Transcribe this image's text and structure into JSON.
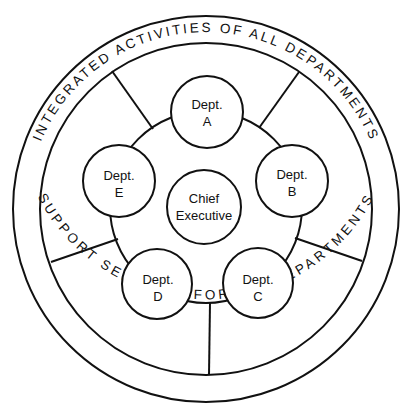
{
  "diagram": {
    "outer_ring": {
      "top_label": "INTEGRATED ACTIVITIES OF ALL DEPARTMENTS",
      "bottom_label": "SUPPORT SERVICES FOR ALL DEPARTMENTS"
    },
    "center": {
      "line1": "Chief",
      "line2": "Executive"
    },
    "departments": [
      {
        "id": "A",
        "line1": "Dept.",
        "line2": "A"
      },
      {
        "id": "B",
        "line1": "Dept.",
        "line2": "B"
      },
      {
        "id": "C",
        "line1": "Dept.",
        "line2": "C"
      },
      {
        "id": "D",
        "line1": "Dept.",
        "line2": "D"
      },
      {
        "id": "E",
        "line1": "Dept.",
        "line2": "E"
      }
    ],
    "colors": {
      "line": "#111111",
      "background": "#ffffff"
    }
  }
}
